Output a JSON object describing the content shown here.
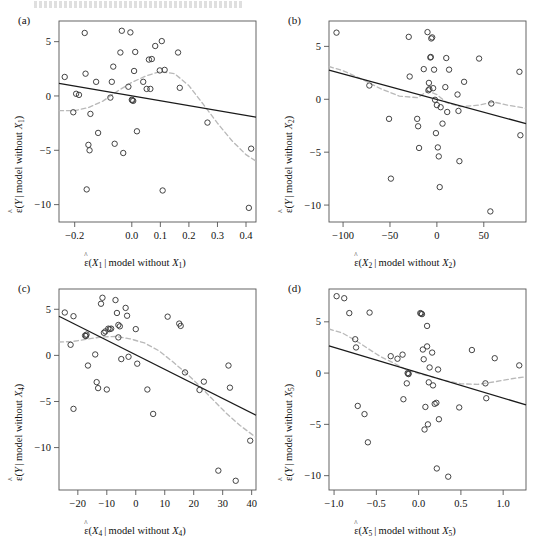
{
  "figure": {
    "type": "added-variable-plots",
    "panel_count": 4,
    "top_cut_text": "",
    "colors": {
      "point_stroke": "#3a3a3a",
      "fit_line": "#1a1a1a",
      "smoother_line": "#b9b9b9",
      "axis": "#555555",
      "background": "#ffffff"
    }
  },
  "panels": [
    {
      "tag": "(a)",
      "ylabel_prefix": "(",
      "ylabel_var": "Y",
      "ylabel_suffix": " | model without ",
      "ylabel_sub": "1",
      "xlabel_var": "X",
      "xlabel_sub": "1",
      "xticks": [
        "-0.2",
        "0.0",
        "0.1",
        "0.2",
        "0.3",
        "0.4"
      ],
      "xtick_values": [
        -0.2,
        0.0,
        0.1,
        0.2,
        0.3,
        0.4
      ],
      "yticks": [
        "5",
        "0",
        "-5",
        "-10"
      ],
      "ytick_values": [
        5,
        0,
        -5,
        -10
      ],
      "xlim": [
        -0.255,
        0.435
      ],
      "ylim": [
        -11.6,
        6.9
      ]
    },
    {
      "tag": "(b)",
      "ylabel_var": "Y",
      "ylabel_sub": "2",
      "xlabel_var": "X",
      "xlabel_sub": "2",
      "xticks": [
        "-100",
        "-50",
        "0",
        "50"
      ],
      "xtick_values": [
        -100,
        -50,
        0,
        50
      ],
      "yticks": [
        "5",
        "0",
        "-5",
        "-10"
      ],
      "ytick_values": [
        5,
        0,
        -5,
        -10
      ],
      "xlim": [
        -115,
        95
      ],
      "ylim": [
        -11.6,
        7.4
      ]
    },
    {
      "tag": "(c)",
      "ylabel_var": "Y",
      "ylabel_sub": "4",
      "xlabel_var": "X",
      "xlabel_sub": "4",
      "xticks": [
        "-20",
        "-10",
        "0",
        "10",
        "20",
        "30",
        "40"
      ],
      "xtick_values": [
        -20,
        -10,
        0,
        10,
        20,
        30,
        40
      ],
      "yticks": [
        "5",
        "0",
        "-5",
        "-10"
      ],
      "ytick_values": [
        5,
        0,
        -5,
        -10
      ],
      "xlim": [
        -26.5,
        41.5
      ],
      "ylim": [
        -14.6,
        7.2
      ]
    },
    {
      "tag": "(d)",
      "ylabel_var": "Y",
      "ylabel_sub": "5",
      "xlabel_var": "X",
      "xlabel_sub": "5",
      "xticks": [
        "-1.0",
        "-0.5",
        "0.0",
        "0.5",
        "1.0"
      ],
      "xtick_values": [
        -1.0,
        -0.5,
        0.0,
        0.5,
        1.0
      ],
      "yticks": [
        "5",
        "0",
        "-5",
        "-10"
      ],
      "ytick_values": [
        5,
        0,
        -5,
        -10
      ],
      "xlim": [
        -1.06,
        1.27
      ],
      "ylim": [
        -11.4,
        8.2
      ]
    }
  ],
  "chart_data": [
    {
      "type": "scatter",
      "panel": "(a)",
      "title": "",
      "xlabel": "e-hat(X1 | model without X1)",
      "ylabel": "e-hat(Y | model without X1)",
      "xlim": [
        -0.255,
        0.435
      ],
      "ylim": [
        -11.6,
        6.9
      ],
      "grid": false,
      "legend": "none",
      "points": [
        [
          -0.235,
          1.75
        ],
        [
          -0.205,
          -1.5
        ],
        [
          -0.195,
          0.2
        ],
        [
          -0.185,
          0.1
        ],
        [
          -0.165,
          5.8
        ],
        [
          -0.162,
          2.05
        ],
        [
          -0.158,
          -8.6
        ],
        [
          -0.152,
          -4.5
        ],
        [
          -0.148,
          -5.0
        ],
        [
          -0.145,
          -1.65
        ],
        [
          -0.125,
          1.3
        ],
        [
          -0.118,
          -3.4
        ],
        [
          -0.075,
          -0.15
        ],
        [
          -0.07,
          1.3
        ],
        [
          -0.065,
          2.7
        ],
        [
          -0.06,
          -4.4
        ],
        [
          -0.04,
          4.0
        ],
        [
          -0.035,
          6.0
        ],
        [
          -0.03,
          -5.25
        ],
        [
          -0.012,
          0.85
        ],
        [
          -0.005,
          5.85
        ],
        [
          0.0,
          -0.35
        ],
        [
          0.002,
          -0.4
        ],
        [
          0.005,
          -0.45
        ],
        [
          0.008,
          2.3
        ],
        [
          0.012,
          4.05
        ],
        [
          0.018,
          -3.25
        ],
        [
          0.04,
          1.3
        ],
        [
          0.052,
          0.65
        ],
        [
          0.06,
          3.35
        ],
        [
          0.065,
          0.65
        ],
        [
          0.07,
          3.4
        ],
        [
          0.082,
          4.6
        ],
        [
          0.098,
          2.35
        ],
        [
          0.105,
          5.05
        ],
        [
          0.108,
          -8.7
        ],
        [
          0.115,
          2.4
        ],
        [
          0.162,
          4.0
        ],
        [
          0.168,
          0.75
        ],
        [
          0.265,
          -2.45
        ],
        [
          0.41,
          -10.3
        ],
        [
          0.418,
          -4.85
        ]
      ],
      "fit_line": {
        "type": "linear",
        "x": [
          -0.255,
          0.435
        ],
        "y": [
          1.15,
          -1.95
        ]
      },
      "smoother": {
        "type": "loess-dashed",
        "x": [
          -0.255,
          -0.2,
          -0.15,
          -0.1,
          -0.05,
          0.0,
          0.05,
          0.1,
          0.15,
          0.2,
          0.25,
          0.3,
          0.35,
          0.4,
          0.435
        ],
        "y": [
          -1.35,
          -1.35,
          -1.05,
          -0.45,
          0.45,
          1.25,
          1.85,
          2.25,
          2.05,
          0.95,
          -0.75,
          -2.5,
          -4.1,
          -5.4,
          -6.0
        ]
      }
    },
    {
      "type": "scatter",
      "panel": "(b)",
      "title": "",
      "xlabel": "e-hat(X2 | model without X2)",
      "ylabel": "e-hat(Y | model without X2)",
      "xlim": [
        -115,
        95
      ],
      "ylim": [
        -11.6,
        7.4
      ],
      "grid": false,
      "legend": "none",
      "points": [
        [
          -107,
          6.3
        ],
        [
          -72,
          1.3
        ],
        [
          -51,
          -1.85
        ],
        [
          -49,
          -7.5
        ],
        [
          -30,
          5.9
        ],
        [
          -29,
          2.15
        ],
        [
          -21,
          -1.85
        ],
        [
          -20,
          -2.55
        ],
        [
          -19,
          -4.6
        ],
        [
          -14,
          2.85
        ],
        [
          -10,
          6.35
        ],
        [
          -9,
          0.85
        ],
        [
          -8,
          0.95
        ],
        [
          -8.5,
          1.55
        ],
        [
          -7,
          3.95
        ],
        [
          -6.5,
          4.0
        ],
        [
          -6,
          5.75
        ],
        [
          -5,
          5.85
        ],
        [
          -4,
          1.05
        ],
        [
          -3,
          2.8
        ],
        [
          -2,
          -0.05
        ],
        [
          -1,
          -3.2
        ],
        [
          0,
          -0.55
        ],
        [
          1,
          -4.55
        ],
        [
          2,
          -5.4
        ],
        [
          3,
          -8.3
        ],
        [
          4,
          -0.75
        ],
        [
          6,
          -2.3
        ],
        [
          9,
          1.15
        ],
        [
          10,
          3.9
        ],
        [
          11,
          -1.2
        ],
        [
          13,
          2.8
        ],
        [
          22,
          0.45
        ],
        [
          23,
          -1.1
        ],
        [
          24,
          -5.85
        ],
        [
          29,
          1.65
        ],
        [
          45,
          3.85
        ],
        [
          57,
          -10.6
        ],
        [
          58,
          -0.4
        ],
        [
          88,
          2.6
        ],
        [
          89,
          -3.4
        ]
      ],
      "fit_line": {
        "type": "linear",
        "x": [
          -115,
          95
        ],
        "y": [
          2.75,
          -2.3
        ]
      },
      "smoother": {
        "type": "loess-dashed",
        "x": [
          -115,
          -100,
          -80,
          -60,
          -40,
          -20,
          -10,
          0,
          10,
          25,
          45,
          60,
          75,
          95
        ],
        "y": [
          3.1,
          2.7,
          1.9,
          1.0,
          0.3,
          0.15,
          0.8,
          0.45,
          -0.3,
          -0.7,
          -0.55,
          -0.25,
          -0.55,
          -0.85
        ]
      }
    },
    {
      "type": "scatter",
      "panel": "(c)",
      "title": "",
      "xlabel": "e-hat(X4 | model without X4)",
      "ylabel": "e-hat(Y | model without X4)",
      "xlim": [
        -26.5,
        41.5
      ],
      "ylim": [
        -14.6,
        7.2
      ],
      "grid": false,
      "legend": "none",
      "points": [
        [
          -24.5,
          4.65
        ],
        [
          -22.5,
          1.15
        ],
        [
          -21.5,
          -5.8
        ],
        [
          -21.5,
          4.25
        ],
        [
          -17.5,
          2.15
        ],
        [
          -17.2,
          2.1
        ],
        [
          -17.0,
          2.25
        ],
        [
          -16.5,
          -1.1
        ],
        [
          -14,
          0.1
        ],
        [
          -13.5,
          -2.9
        ],
        [
          -13,
          -3.55
        ],
        [
          -12,
          5.6
        ],
        [
          -11.5,
          6.25
        ],
        [
          -11,
          2.45
        ],
        [
          -10.5,
          2.6
        ],
        [
          -10,
          -3.7
        ],
        [
          -9.5,
          2.9
        ],
        [
          -9,
          2.85
        ],
        [
          -8.5,
          2.9
        ],
        [
          -7,
          6.0
        ],
        [
          -6.5,
          4.6
        ],
        [
          -6,
          3.3
        ],
        [
          -6,
          1.95
        ],
        [
          -5.5,
          3.15
        ],
        [
          -5,
          -0.4
        ],
        [
          -3.5,
          5.15
        ],
        [
          -3,
          4.3
        ],
        [
          -2.5,
          -0.15
        ],
        [
          0,
          2.85
        ],
        [
          0.5,
          -0.9
        ],
        [
          4,
          -3.7
        ],
        [
          6,
          -6.35
        ],
        [
          11,
          4.2
        ],
        [
          15,
          3.45
        ],
        [
          15.5,
          3.2
        ],
        [
          17,
          -1.85
        ],
        [
          22,
          -3.75
        ],
        [
          23.5,
          -2.85
        ],
        [
          28.5,
          -12.5
        ],
        [
          32,
          -1.1
        ],
        [
          32.5,
          -3.5
        ],
        [
          34.5,
          -13.6
        ],
        [
          39.5,
          -9.25
        ]
      ],
      "fit_line": {
        "type": "linear",
        "x": [
          -26.5,
          41.5
        ],
        "y": [
          4.25,
          -6.5
        ]
      },
      "smoother": {
        "type": "loess-dashed",
        "x": [
          -26.5,
          -22,
          -17,
          -12,
          -7,
          -2,
          3,
          8,
          13,
          18,
          22,
          26,
          31,
          36,
          41.5
        ],
        "y": [
          1.45,
          1.5,
          1.75,
          2.0,
          2.05,
          1.8,
          1.35,
          0.5,
          -0.75,
          -2.1,
          -3.3,
          -4.6,
          -6.2,
          -7.6,
          -8.9
        ]
      }
    },
    {
      "type": "scatter",
      "panel": "(d)",
      "title": "",
      "xlabel": "e-hat(X5 | model without X5)",
      "ylabel": "e-hat(Y | model without X5)",
      "xlim": [
        -1.06,
        1.27
      ],
      "ylim": [
        -11.4,
        8.2
      ],
      "grid": false,
      "legend": "none",
      "points": [
        [
          -0.97,
          7.5
        ],
        [
          -0.88,
          7.3
        ],
        [
          -0.82,
          5.85
        ],
        [
          -0.75,
          3.3
        ],
        [
          -0.74,
          2.5
        ],
        [
          -0.72,
          -3.2
        ],
        [
          -0.64,
          -4.0
        ],
        [
          -0.6,
          -6.75
        ],
        [
          -0.58,
          5.9
        ],
        [
          -0.33,
          1.65
        ],
        [
          -0.25,
          1.4
        ],
        [
          -0.19,
          1.8
        ],
        [
          -0.18,
          -2.55
        ],
        [
          -0.14,
          -1.0
        ],
        [
          -0.13,
          0.0
        ],
        [
          -0.12,
          -0.05
        ],
        [
          -0.12,
          -0.1
        ],
        [
          0.02,
          5.85
        ],
        [
          0.03,
          5.8
        ],
        [
          0.04,
          5.75
        ],
        [
          0.05,
          2.3
        ],
        [
          0.06,
          1.35
        ],
        [
          0.07,
          -5.5
        ],
        [
          0.08,
          -3.3
        ],
        [
          0.1,
          2.6
        ],
        [
          0.1,
          4.6
        ],
        [
          0.11,
          -5.0
        ],
        [
          0.12,
          -0.9
        ],
        [
          0.13,
          0.55
        ],
        [
          0.16,
          2.0
        ],
        [
          0.17,
          -1.2
        ],
        [
          0.19,
          -3.0
        ],
        [
          0.21,
          -2.9
        ],
        [
          0.215,
          -9.3
        ],
        [
          0.23,
          0.35
        ],
        [
          0.24,
          -4.5
        ],
        [
          0.35,
          -10.1
        ],
        [
          0.48,
          -3.35
        ],
        [
          0.63,
          2.25
        ],
        [
          0.79,
          -1.0
        ],
        [
          0.8,
          -2.45
        ],
        [
          0.9,
          1.45
        ],
        [
          1.19,
          0.75
        ]
      ],
      "fit_line": {
        "type": "linear",
        "x": [
          -1.06,
          1.27
        ],
        "y": [
          2.65,
          -3.1
        ]
      },
      "smoother": {
        "type": "loess-dashed",
        "x": [
          -1.06,
          -0.9,
          -0.75,
          -0.6,
          -0.45,
          -0.3,
          -0.15,
          0.0,
          0.15,
          0.3,
          0.5,
          0.7,
          0.9,
          1.1,
          1.27
        ],
        "y": [
          4.3,
          3.9,
          3.2,
          2.4,
          1.6,
          1.0,
          0.35,
          -0.05,
          -0.35,
          -0.7,
          -1.05,
          -1.1,
          -0.85,
          -0.55,
          -0.35
        ]
      }
    }
  ]
}
